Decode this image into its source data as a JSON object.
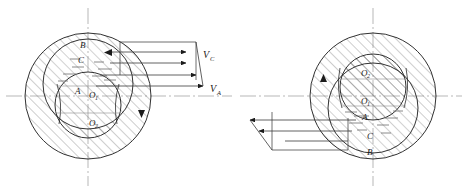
{
  "figure": {
    "type": "engineering-diagram",
    "background_color": "#ffffff",
    "line_color": "#1b1b1b",
    "hatch_color": "#6b6b6b",
    "axis_color": "#8a8a8a"
  },
  "left_figure": {
    "name": "left-bearing",
    "outer_circle": {
      "cx": 88,
      "cy": 96,
      "r": 63
    },
    "middle_circle": {
      "cx": 88,
      "cy": 84,
      "r": 45
    },
    "inner_circle": {
      "cx": 88,
      "cy": 105,
      "r": 33
    },
    "points": [
      {
        "id": "B",
        "label": "B",
        "x": 84,
        "y": 45
      },
      {
        "id": "C",
        "label": "C",
        "x": 82,
        "y": 60
      },
      {
        "id": "A",
        "label": "A",
        "x": 79,
        "y": 91
      },
      {
        "id": "O1",
        "label": "O",
        "sub": "1",
        "x": 92,
        "y": 95
      },
      {
        "id": "O2",
        "label": "O",
        "sub": "2",
        "x": 92,
        "y": 123
      }
    ],
    "rotation_arrow": {
      "direction": "clockwise",
      "glyph": "solid-triangle",
      "x": 141,
      "y": 114
    }
  },
  "right_figure": {
    "name": "right-bearing",
    "outer_circle": {
      "cx": 373,
      "cy": 96,
      "r": 63
    },
    "middle_circle": {
      "cx": 373,
      "cy": 108,
      "r": 45
    },
    "inner_circle": {
      "cx": 373,
      "cy": 87,
      "r": 33
    },
    "points": [
      {
        "id": "O2",
        "label": "O",
        "sub": "2",
        "x": 365,
        "y": 73
      },
      {
        "id": "O1",
        "label": "O",
        "sub": "1",
        "x": 365,
        "y": 101
      },
      {
        "id": "A",
        "label": "A",
        "x": 366,
        "y": 117
      },
      {
        "id": "C",
        "label": "C",
        "x": 371,
        "y": 136
      },
      {
        "id": "B",
        "label": "B",
        "x": 371,
        "y": 152
      }
    ],
    "rotation_arrow": {
      "direction": "counter-clockwise",
      "glyph": "solid-triangle",
      "x": 322,
      "y": 78
    }
  },
  "velocity_left": {
    "name": "left-velocity-profile",
    "direction": "right",
    "labels": [
      {
        "id": "Vc",
        "symbol": "V",
        "sub": "C",
        "x": 206,
        "y": 58
      },
      {
        "id": "Va",
        "symbol": "V",
        "sub": "A",
        "x": 212,
        "y": 90
      }
    ],
    "arrows": [
      {
        "y": 50,
        "x_start": 120,
        "x_end": 196
      },
      {
        "y": 62,
        "x_start": 107,
        "x_end": 190
      },
      {
        "y": 74,
        "x_start": 100,
        "x_end": 196
      },
      {
        "y": 86,
        "x_start": 96,
        "x_end": 203
      }
    ],
    "top_arrow_back": {
      "x": 120,
      "y1": 42,
      "y2": 50,
      "tip_x": 110
    }
  },
  "velocity_right": {
    "name": "right-velocity-profile",
    "direction": "left",
    "arrows": [
      {
        "y": 120,
        "x_start": 348,
        "x_end": 241
      },
      {
        "y": 132,
        "x_start": 355,
        "x_end": 248
      },
      {
        "y": 142,
        "x_start": 348,
        "x_end": 272
      }
    ]
  },
  "axes": {
    "left_vertical": {
      "x": 88,
      "y1": 8,
      "y2": 186
    },
    "left_horizontal": {
      "y": 96,
      "x1": 6,
      "x2": 232
    },
    "right_vertical": {
      "x": 373,
      "y1": 8,
      "y2": 186
    },
    "right_horizontal": {
      "y": 96,
      "x1": 240,
      "x2": 462
    }
  }
}
